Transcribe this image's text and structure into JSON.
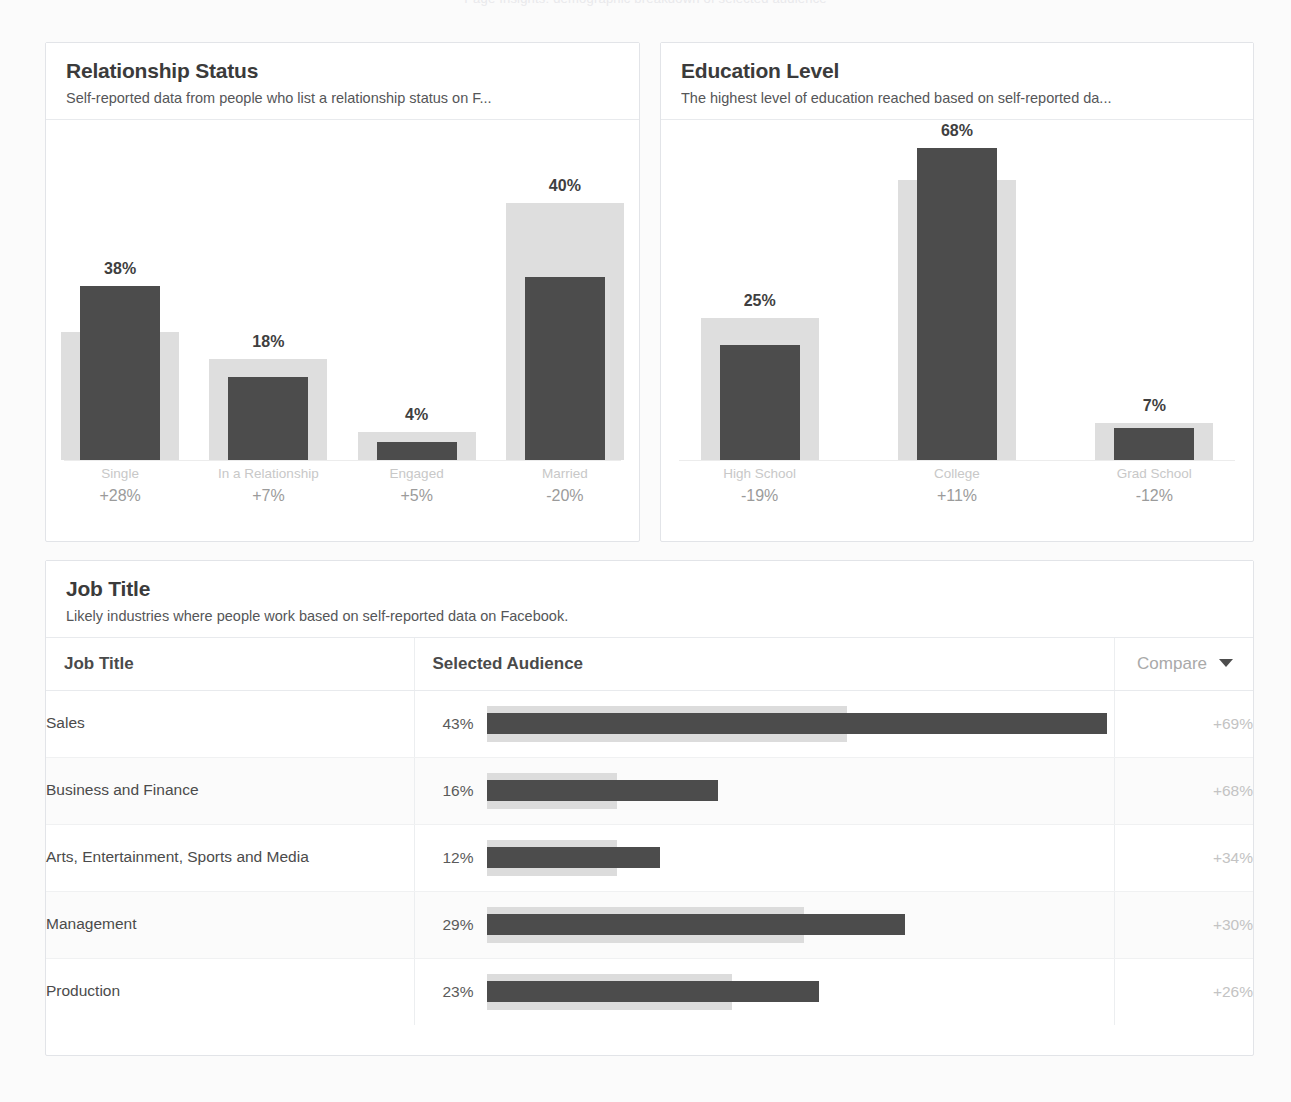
{
  "page": {
    "ghost_header": "Page Insights: demographic breakdown of selected audience"
  },
  "cards": {
    "relationship": {
      "title": "Relationship Status",
      "subtitle": "Self-reported data from people who list a relationship status on F..."
    },
    "education": {
      "title": "Education Level",
      "subtitle": "The highest level of education reached based on self-reported da..."
    },
    "jobtitle": {
      "title": "Job Title",
      "subtitle": "Likely industries where people work based on self-reported data on Facebook."
    }
  },
  "table": {
    "headers": {
      "job_title": "Job Title",
      "selected_audience": "Selected Audience",
      "compare": "Compare",
      "sort_icon": "caret-down-icon"
    },
    "rows": [
      {
        "job": "Sales",
        "pct": "43%",
        "compare": "+69%"
      },
      {
        "job": "Business and Finance",
        "pct": "16%",
        "compare": "+68%"
      },
      {
        "job": "Arts, Entertainment, Sports and Media",
        "pct": "12%",
        "compare": "+34%"
      },
      {
        "job": "Management",
        "pct": "29%",
        "compare": "+30%"
      },
      {
        "job": "Production",
        "pct": "23%",
        "compare": "+26%"
      }
    ]
  },
  "colors": {
    "selected_bar": "#4c4c4c",
    "compare_bar": "#dedede",
    "title_text": "#3b3b3b",
    "muted_text": "#c3c3c3",
    "card_border": "#e2e4e8"
  },
  "chart_data": [
    {
      "type": "bar",
      "title": "Relationship Status",
      "subtitle": "Self-reported data from people who list a relationship status on F...",
      "xlabel": "",
      "ylabel": "",
      "ylim": [
        0,
        72
      ],
      "grid": false,
      "legend": "none",
      "categories": [
        "Single",
        "In a Relationship",
        "Engaged",
        "Married"
      ],
      "series": [
        {
          "name": "Selected Audience",
          "values": [
            38,
            18,
            4,
            40
          ]
        },
        {
          "name": "Compare (all Facebook)",
          "values": [
            28,
            22,
            6,
            56
          ]
        }
      ],
      "value_labels": [
        "38%",
        "18%",
        "4%",
        "40%"
      ],
      "delta_labels": [
        "+28%",
        "+7%",
        "+5%",
        "-20%"
      ]
    },
    {
      "type": "bar",
      "title": "Education Level",
      "subtitle": "The highest level of education reached based on self-reported da...",
      "xlabel": "",
      "ylabel": "",
      "ylim": [
        0,
        72
      ],
      "grid": false,
      "legend": "none",
      "categories": [
        "High School",
        "College",
        "Grad School"
      ],
      "series": [
        {
          "name": "Selected Audience",
          "values": [
            25,
            68,
            7
          ]
        },
        {
          "name": "Compare (all Facebook)",
          "values": [
            31,
            61,
            8
          ]
        }
      ],
      "value_labels": [
        "25%",
        "68%",
        "7%"
      ],
      "delta_labels": [
        "-19%",
        "+11%",
        "-12%"
      ]
    },
    {
      "type": "bar",
      "title": "Job Title",
      "subtitle": "Likely industries where people work based on self-reported data on Facebook.",
      "orientation": "horizontal",
      "xlabel": "",
      "ylabel": "",
      "grid": false,
      "legend": "none",
      "categories": [
        "Sales",
        "Business and Finance",
        "Arts, Entertainment, Sports and Media",
        "Management",
        "Production"
      ],
      "series": [
        {
          "name": "Selected Audience",
          "values": [
            43,
            16,
            12,
            29,
            23
          ]
        },
        {
          "name": "Compare (all Facebook)",
          "values": [
            25,
            9,
            9,
            22,
            17
          ]
        }
      ],
      "value_labels": [
        "43%",
        "16%",
        "12%",
        "29%",
        "23%"
      ],
      "compare_labels": [
        "+69%",
        "+68%",
        "+34%",
        "+30%",
        "+26%"
      ]
    }
  ]
}
